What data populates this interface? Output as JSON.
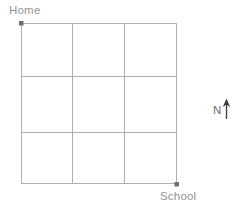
{
  "figure": {
    "type": "street-grid-map",
    "background_color": "#ffffff",
    "line_color": "#b0b0b0",
    "marker_color": "#6e6e6e",
    "label_color": "#949494"
  },
  "grid": {
    "rows": 3,
    "columns": 3,
    "left": 21,
    "top": 23,
    "right": 177,
    "bottom": 184,
    "vertical_lines": [
      21,
      72,
      124,
      177
    ],
    "horizontal_lines": [
      23,
      76,
      132,
      184
    ]
  },
  "markers": [
    {
      "name": "home",
      "label": "Home",
      "x": 21,
      "y": 23,
      "label_x": 9,
      "label_y": 4,
      "corner": "top-left"
    },
    {
      "name": "school",
      "label": "School",
      "x": 177,
      "y": 184,
      "label_x": 160,
      "label_y": 190,
      "corner": "bottom-right"
    }
  ],
  "compass": {
    "letter": "N",
    "direction": "north",
    "arrow_points_up": true,
    "x": 213,
    "y": 104
  }
}
